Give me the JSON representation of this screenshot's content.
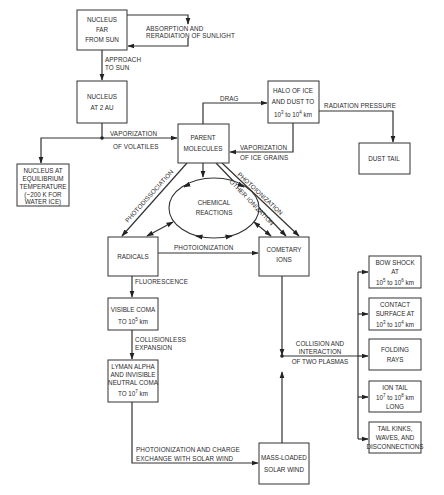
{
  "diagram": {
    "nodes": {
      "nucleus_far": {
        "lines": [
          "NUCLEUS",
          "FAR",
          "FROM SUN"
        ]
      },
      "nucleus_2au": {
        "lines": [
          "NUCLEUS",
          "AT 2 AU"
        ]
      },
      "nucleus_equilibrium": {
        "lines": [
          "NUCLEUS AT",
          "EQUILIBRIUM",
          "TEMPERATURE",
          "(~200 K FOR",
          "WATER ICE)"
        ]
      },
      "parent_molecules": {
        "lines": [
          "PARENT",
          "MOLECULES"
        ]
      },
      "halo": {
        "lines": [
          "HALO OF ICE",
          "AND DUST TO"
        ],
        "range_base1": "10",
        "range_exp1": "3",
        "range_mid": " to ",
        "range_base2": "10",
        "range_exp2": "4",
        "range_unit": " km"
      },
      "dust_tail": {
        "lines": [
          "DUST TAIL"
        ]
      },
      "chemical_reactions": {
        "lines": [
          "CHEMICAL",
          "REACTIONS"
        ]
      },
      "radicals": {
        "lines": [
          "RADICALS"
        ]
      },
      "cometary_ions": {
        "lines": [
          "COMETARY",
          "IONS"
        ]
      },
      "visible_coma": {
        "lines": [
          "VISIBLE COMA"
        ],
        "range_prefix": "TO ",
        "range_base": "10",
        "range_exp": "5",
        "range_unit": " km"
      },
      "lyman_alpha": {
        "lines": [
          "LYMAN ALPHA",
          "AND INVISIBLE",
          "NEUTRAL COMA"
        ],
        "range_prefix": "TO ",
        "range_base": "10",
        "range_exp": "7",
        "range_unit": " km"
      },
      "mass_loaded": {
        "lines": [
          "MASS-LOADED",
          "SOLAR WIND"
        ]
      },
      "bow_shock": {
        "lines": [
          "BOW SHOCK",
          "AT"
        ],
        "range_base1": "10",
        "range_exp1": "5",
        "range_mid": " to ",
        "range_base2": "10",
        "range_exp2": "6",
        "range_unit": " km"
      },
      "contact_surface": {
        "lines": [
          "CONTACT",
          "SURFACE AT"
        ],
        "range_base1": "10",
        "range_exp1": "3",
        "range_mid": " to ",
        "range_base2": "10",
        "range_exp2": "4",
        "range_unit": " km"
      },
      "folding_rays": {
        "lines": [
          "FOLDING",
          "RAYS"
        ]
      },
      "ion_tail": {
        "lines": [
          "ION TAIL",
          "LONG"
        ],
        "range_base1": "10",
        "range_exp1": "7",
        "range_mid": " to ",
        "range_base2": "10",
        "range_exp2": "8",
        "range_unit": " km"
      },
      "tail_kinks": {
        "lines": [
          "TAIL KINKS,",
          "WAVES, AND",
          "DISCONNECTIONS"
        ]
      }
    },
    "edge_labels": {
      "absorption": [
        "ABSORPTION AND",
        "RERADIATION OF SUNLIGHT"
      ],
      "approach": [
        "APPROACH",
        "TO SUN"
      ],
      "vaporization_volatiles": [
        "VAPORIZATION",
        "OF VOLATILES"
      ],
      "drag": "DRAG",
      "radiation_pressure": "RADIATION PRESSURE",
      "vaporization_ice": [
        "VAPORIZATION",
        "OF ICE GRAINS"
      ],
      "photodissociation": "PHOTODISSOCIATION",
      "photoionization_diag": "PHOTOIONIZATION",
      "other_ionization": "OTHER IONIZATION",
      "photoionization_horiz": "PHOTOIONIZATION",
      "fluorescence": "FLUORESCENCE",
      "collisionless": [
        "COLLISIONLESS",
        "EXPANSION"
      ],
      "collision": [
        "COLLISION AND",
        "INTERACTION",
        "OF TWO PLASMAS"
      ],
      "photoionization_charge": [
        "PHOTOIONIZATION AND CHARGE",
        "EXCHANGE WITH SOLAR WIND"
      ]
    }
  }
}
